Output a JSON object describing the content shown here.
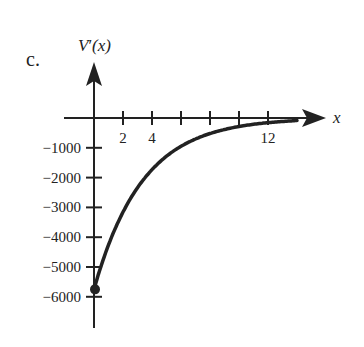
{
  "figure": {
    "part_label": "c.",
    "y_axis_label_main": "V",
    "y_axis_label_prime": "′",
    "y_axis_label_arg": "(x)",
    "x_axis_label": "x"
  },
  "colors": {
    "ink": "#222222",
    "background": "#ffffff"
  },
  "chart_data": {
    "type": "line",
    "title": "",
    "xlabel": "x",
    "ylabel": "V′(x)",
    "x_ticks": [
      2,
      4,
      6,
      8,
      10,
      12
    ],
    "x_tick_labels": [
      "2",
      "4",
      "",
      "",
      "",
      "12"
    ],
    "y_ticks": [
      -1000,
      -2000,
      -3000,
      -4000,
      -5000,
      -6000
    ],
    "y_tick_labels": [
      "−1000",
      "−2000",
      "−3000",
      "−4000",
      "−5000",
      "−6000"
    ],
    "xlim": [
      0,
      14
    ],
    "ylim": [
      -7000,
      1000
    ],
    "grid": false,
    "legend": null,
    "series": [
      {
        "name": "V′(x)",
        "x": [
          0,
          1,
          2,
          3,
          4,
          5,
          6,
          7,
          8,
          9,
          10,
          11,
          12,
          13,
          14
        ],
        "y": [
          -5750,
          -4000,
          -2950,
          -2250,
          -1700,
          -1300,
          -1000,
          -750,
          -570,
          -430,
          -320,
          -240,
          -170,
          -110,
          -60
        ]
      }
    ],
    "annotations": [
      {
        "type": "closed-point",
        "x": 0,
        "y": -5750
      }
    ]
  }
}
